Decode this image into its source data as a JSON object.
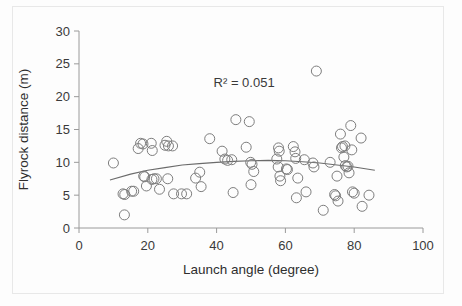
{
  "chart_data": {
    "type": "scatter",
    "title": "",
    "xlabel": "Launch angle (degree)",
    "ylabel": "Flyrock distance (m)",
    "xlim": [
      0,
      100
    ],
    "ylim": [
      0,
      30
    ],
    "xticks": [
      0,
      20,
      40,
      60,
      80,
      100
    ],
    "yticks": [
      0,
      5,
      10,
      15,
      20,
      25,
      30
    ],
    "xtick_labels": [
      "0",
      "20",
      "40",
      "60",
      "80",
      "100"
    ],
    "ytick_labels": [
      "0",
      "5",
      "10",
      "15",
      "20",
      "25",
      "30"
    ],
    "grid": false,
    "legend": null,
    "annotations": [
      {
        "text": "R² = 0.051",
        "x": 48,
        "y": 21.5
      }
    ],
    "marker": {
      "shape": "open-circle",
      "size": 5,
      "color": "#7d7d7d"
    },
    "series": [
      {
        "name": "Flyrock observations",
        "points": [
          [
            10.0,
            9.9
          ],
          [
            12.8,
            5.2
          ],
          [
            13.3,
            5.1
          ],
          [
            13.2,
            2.0
          ],
          [
            15.3,
            5.6
          ],
          [
            15.9,
            5.6
          ],
          [
            17.2,
            12.1
          ],
          [
            17.9,
            12.9
          ],
          [
            18.6,
            12.8
          ],
          [
            18.8,
            7.9
          ],
          [
            19.1,
            7.8
          ],
          [
            19.6,
            6.4
          ],
          [
            21.0,
            12.9
          ],
          [
            21.3,
            11.8
          ],
          [
            21.2,
            7.4
          ],
          [
            21.8,
            7.5
          ],
          [
            22.5,
            7.5
          ],
          [
            23.4,
            5.9
          ],
          [
            25.0,
            12.6
          ],
          [
            25.5,
            13.2
          ],
          [
            25.8,
            7.5
          ],
          [
            26.0,
            12.5
          ],
          [
            27.2,
            12.5
          ],
          [
            27.5,
            5.2
          ],
          [
            29.8,
            5.2
          ],
          [
            31.3,
            5.2
          ],
          [
            33.9,
            7.6
          ],
          [
            35.1,
            8.5
          ],
          [
            35.5,
            6.3
          ],
          [
            38.0,
            13.6
          ],
          [
            41.6,
            11.7
          ],
          [
            42.4,
            10.5
          ],
          [
            43.2,
            10.3
          ],
          [
            44.4,
            10.4
          ],
          [
            44.8,
            5.4
          ],
          [
            45.6,
            16.5
          ],
          [
            48.6,
            12.3
          ],
          [
            49.5,
            16.2
          ],
          [
            49.9,
            10.0
          ],
          [
            50.3,
            9.7
          ],
          [
            50.0,
            6.6
          ],
          [
            50.8,
            8.6
          ],
          [
            57.5,
            10.5
          ],
          [
            57.9,
            9.3
          ],
          [
            58.0,
            12.2
          ],
          [
            58.2,
            11.7
          ],
          [
            58.4,
            7.9
          ],
          [
            58.6,
            7.2
          ],
          [
            60.3,
            9.0
          ],
          [
            60.6,
            8.9
          ],
          [
            62.3,
            12.4
          ],
          [
            62.8,
            11.6
          ],
          [
            63.0,
            10.6
          ],
          [
            63.2,
            4.6
          ],
          [
            63.6,
            7.6
          ],
          [
            65.5,
            10.4
          ],
          [
            66.0,
            5.5
          ],
          [
            68.0,
            9.9
          ],
          [
            68.3,
            9.3
          ],
          [
            69.0,
            23.9
          ],
          [
            71.0,
            2.7
          ],
          [
            73.0,
            10.0
          ],
          [
            74.3,
            5.1
          ],
          [
            74.6,
            4.9
          ],
          [
            75.0,
            7.9
          ],
          [
            75.3,
            4.1
          ],
          [
            76.0,
            14.3
          ],
          [
            76.3,
            12.2
          ],
          [
            76.6,
            12.4
          ],
          [
            77.0,
            10.8
          ],
          [
            77.3,
            12.5
          ],
          [
            77.4,
            9.5
          ],
          [
            77.8,
            9.3
          ],
          [
            78.2,
            9.4
          ],
          [
            78.5,
            8.4
          ],
          [
            79.0,
            15.6
          ],
          [
            79.3,
            11.9
          ],
          [
            79.5,
            5.5
          ],
          [
            80.0,
            5.3
          ],
          [
            82.0,
            13.7
          ],
          [
            82.3,
            3.3
          ],
          [
            84.3,
            5.0
          ]
        ]
      }
    ],
    "trendline": {
      "type": "polynomial-quadratic",
      "r_squared": 0.051,
      "color": "#6b6b6b",
      "x_start": 9.0,
      "x_end": 86.0,
      "points": [
        [
          9.0,
          7.3
        ],
        [
          15.0,
          8.2
        ],
        [
          20.0,
          8.8
        ],
        [
          25.0,
          9.2
        ],
        [
          30.0,
          9.6
        ],
        [
          35.0,
          9.8
        ],
        [
          40.0,
          10.0
        ],
        [
          45.0,
          10.15
        ],
        [
          50.0,
          10.25
        ],
        [
          55.0,
          10.3
        ],
        [
          60.0,
          10.25
        ],
        [
          65.0,
          10.1
        ],
        [
          70.0,
          9.9
        ],
        [
          75.0,
          9.6
        ],
        [
          80.0,
          9.3
        ],
        [
          86.0,
          8.8
        ]
      ]
    }
  }
}
